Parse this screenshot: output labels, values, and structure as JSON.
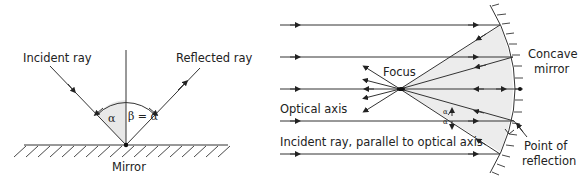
{
  "left_diagram": {
    "title": "Plane mirror reflection",
    "labels": {
      "incident": "Incident ray",
      "reflected": "Reflected ray",
      "mirror": "Mirror",
      "alpha": "α",
      "beta_eq": "β = α"
    }
  },
  "right_diagram": {
    "title": "Concave mirror reflection",
    "labels": {
      "focus": "Focus",
      "concave_1": "Concave",
      "concave_2": "mirror",
      "optical_axis": "Optical axis",
      "incident_parallel": "Incident ray, parallel to optical axis",
      "point_1": "Point of",
      "point_2": "reflection",
      "alpha_1": "α",
      "alpha_2": "α"
    }
  },
  "colors": {
    "line": "#333333",
    "shade": "#e8e8e8",
    "text": "#222222"
  }
}
